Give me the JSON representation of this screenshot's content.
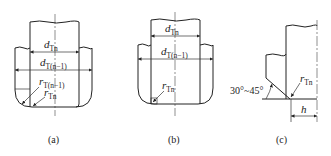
{
  "figure": {
    "panels": [
      {
        "id": "a",
        "caption": "(a)",
        "labels": {
          "d_inner_main": "d",
          "d_inner_sub": "Tn",
          "d_outer_main": "d",
          "d_outer_sub": "T(n−1)",
          "r_outer_main": "r",
          "r_outer_sub": "T(n−1)",
          "r_inner_main": "r",
          "r_inner_sub": "Tn"
        }
      },
      {
        "id": "b",
        "caption": "(b)",
        "labels": {
          "d_inner_main": "d",
          "d_inner_sub": "Tn",
          "d_outer_main": "d",
          "d_outer_sub": "T(n−1)",
          "r_main": "r",
          "r_sub": "Tn"
        }
      },
      {
        "id": "c",
        "caption": "(c)",
        "labels": {
          "angle": "30°~45°",
          "r_main": "r",
          "r_sub": "Tn",
          "h": "h"
        }
      }
    ]
  }
}
